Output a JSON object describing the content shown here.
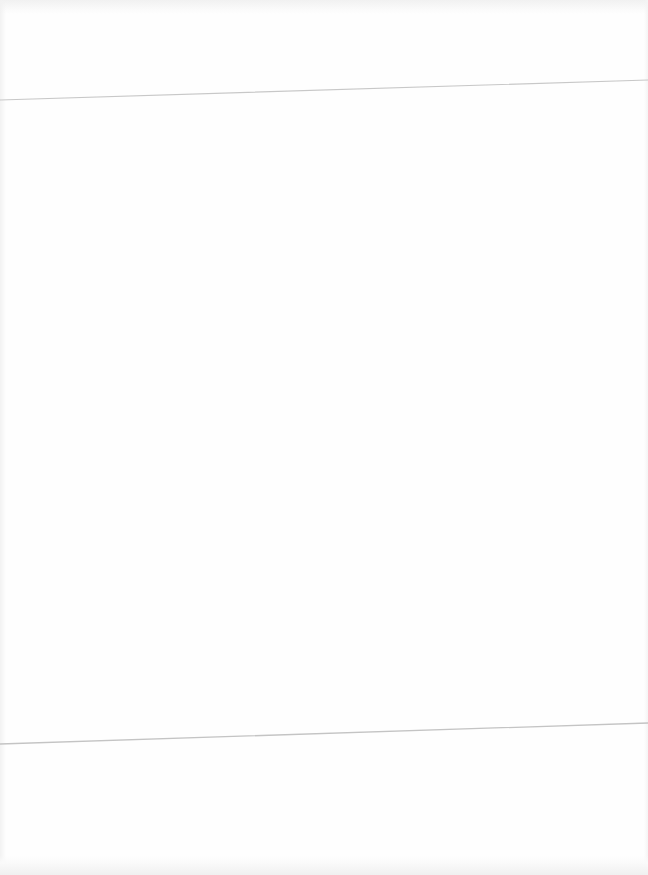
{
  "page": {
    "background": "#fefefe",
    "text": ""
  },
  "fold_lines": [
    {
      "x1": 0,
      "y1": 100,
      "x2": 648,
      "y2": 80,
      "color": "#c8c8c8"
    },
    {
      "x1": 0,
      "y1": 744,
      "x2": 648,
      "y2": 723,
      "color": "#c4c4c4"
    }
  ]
}
